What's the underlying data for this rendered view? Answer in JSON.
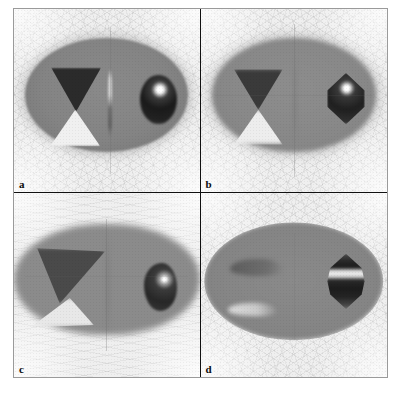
{
  "figure": {
    "kind": "tomographic-reconstruction-panel-grid",
    "rows": 2,
    "columns": 2,
    "background_color": "#f2f2f2",
    "frame_color": "#9a9a9a",
    "divider_color": "#111111",
    "colorscale": "grayscale"
  },
  "panels": [
    {
      "id": "a",
      "label": "a",
      "position": "top-left",
      "body_shape": "ellipse",
      "body_gray": "#848484",
      "background_gray": "#efefef",
      "blur": "low",
      "features": [
        {
          "name": "dark-triangle",
          "shape": "triangle-down",
          "gray": "#2b2b2b"
        },
        {
          "name": "bright-triangle",
          "shape": "triangle-up",
          "gray": "#f0f0f0"
        },
        {
          "name": "vertical-rod",
          "shape": "thin-rod",
          "gray": "#cfcfcf to #5d5d5d"
        },
        {
          "name": "sphere",
          "shape": "circle",
          "gray": "#1a1a1a",
          "highlight": "#ffffff"
        }
      ]
    },
    {
      "id": "b",
      "label": "b",
      "position": "top-right",
      "body_shape": "ellipse",
      "body_gray": "#888888",
      "background_gray": "#f1f1f1",
      "blur": "low",
      "features": [
        {
          "name": "dark-triangle",
          "shape": "triangle-down",
          "gray": "#3a3a3a"
        },
        {
          "name": "bright-triangle",
          "shape": "triangle-up",
          "gray": "#ededed"
        },
        {
          "name": "vertical-rod",
          "shape": "faint-rod",
          "gray": "#6f6f6f"
        },
        {
          "name": "sphere",
          "shape": "cone-hexagon",
          "gray": "#1f1f1f",
          "highlight": "#ffffff"
        }
      ]
    },
    {
      "id": "c",
      "label": "c",
      "position": "bottom-left",
      "body_shape": "stadium",
      "body_gray": "#8b8b8b",
      "background_gray": "#f4f4f4",
      "blur": "high-horizontal",
      "features": [
        {
          "name": "dark-triangle",
          "shape": "sheared-triangle",
          "gray": "#4a4a4a"
        },
        {
          "name": "bright-triangle",
          "shape": "sheared-triangle",
          "gray": "#e8e8e8"
        },
        {
          "name": "vertical-rod",
          "shape": "faint-rod",
          "gray": "#6f6f6f"
        },
        {
          "name": "sphere",
          "shape": "smeared-blob",
          "gray": "#272727",
          "highlight": "#ffffff"
        }
      ]
    },
    {
      "id": "d",
      "label": "d",
      "position": "bottom-right",
      "body_shape": "lens",
      "body_gray": "#858585",
      "background_gray": "#f3f3f3",
      "blur": "medium",
      "features": [
        {
          "name": "dark-triangle",
          "shape": "crescent-smear",
          "gray": "#5c5c5c"
        },
        {
          "name": "bright-triangle",
          "shape": "crescent-smear",
          "gray": "#dcdcdc"
        },
        {
          "name": "vertical-rod",
          "shape": "absent",
          "gray": "#808080"
        },
        {
          "name": "sphere",
          "shape": "banded-hexagon",
          "gray": "#1c1c1c",
          "highlight": "#efefef"
        }
      ]
    }
  ]
}
